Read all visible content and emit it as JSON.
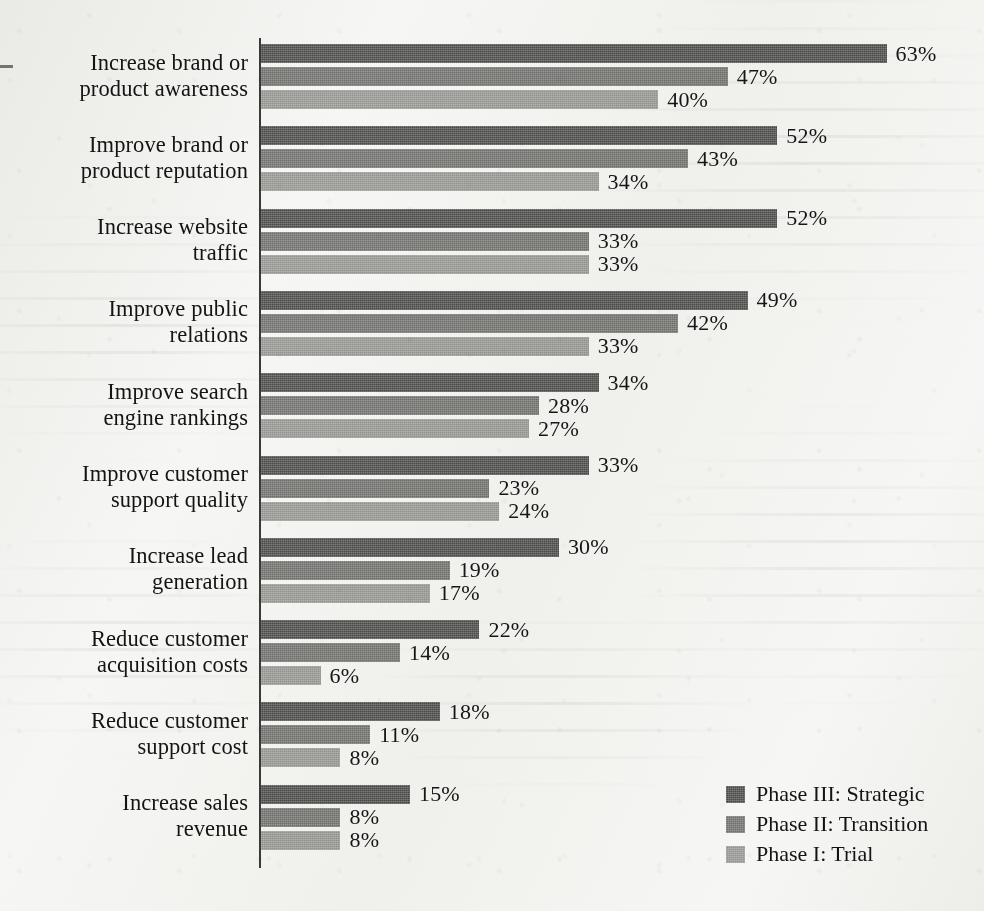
{
  "chart_data": {
    "type": "bar",
    "orientation": "horizontal",
    "title": "",
    "subtitle": "",
    "xlabel": "",
    "ylabel": "",
    "xlim": [
      0,
      70
    ],
    "grid": false,
    "legend_position": "bottom-right",
    "value_suffix": "%",
    "categories": [
      "Increase brand or product awareness",
      "Improve brand or product reputation",
      "Increase website traffic",
      "Improve public relations",
      "Improve search engine rankings",
      "Improve customer support quality",
      "Increase lead generation",
      "Reduce customer acquisition costs",
      "Reduce customer support cost",
      "Increase sales revenue"
    ],
    "category_lines": [
      [
        "Increase brand or",
        "product awareness"
      ],
      [
        "Improve brand or",
        "product reputation"
      ],
      [
        "Increase website",
        "traffic"
      ],
      [
        "Improve public",
        "relations"
      ],
      [
        "Improve search",
        "engine rankings"
      ],
      [
        "Improve customer",
        "support quality"
      ],
      [
        "Increase lead",
        "generation"
      ],
      [
        "Reduce customer",
        "acquisition costs"
      ],
      [
        "Reduce customer",
        "support cost"
      ],
      [
        "Increase sales",
        "revenue"
      ]
    ],
    "series": [
      {
        "name": "Phase III: Strategic",
        "color": "#4a4a48",
        "values": [
          63,
          52,
          52,
          49,
          34,
          33,
          30,
          22,
          18,
          15
        ],
        "labels": [
          "63%",
          "52%",
          "52%",
          "49%",
          "34%",
          "33%",
          "30%",
          "22%",
          "18%",
          "15%"
        ]
      },
      {
        "name": "Phase II: Transition",
        "color": "#6f6f6c",
        "values": [
          47,
          43,
          33,
          42,
          28,
          23,
          19,
          14,
          11,
          8
        ],
        "labels": [
          "47%",
          "43%",
          "33%",
          "42%",
          "28%",
          "23%",
          "19%",
          "14%",
          "11%",
          "8%"
        ]
      },
      {
        "name": "Phase I: Trial",
        "color": "#949491",
        "values": [
          40,
          34,
          33,
          33,
          27,
          24,
          17,
          6,
          8,
          8
        ],
        "labels": [
          "40%",
          "34%",
          "33%",
          "33%",
          "27%",
          "24%",
          "17%",
          "6%",
          "8%",
          "8%"
        ]
      }
    ]
  },
  "legend": {
    "items": [
      {
        "label": "Phase III: Strategic",
        "color": "#4a4a48"
      },
      {
        "label": "Phase II: Transition",
        "color": "#6f6f6c"
      },
      {
        "label": "Phase I: Trial",
        "color": "#949491"
      }
    ]
  }
}
